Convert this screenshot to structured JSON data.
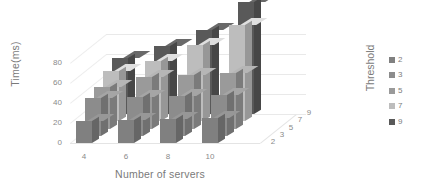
{
  "chart_data": {
    "type": "bar",
    "subtype": "3d-grouped-column",
    "title": "",
    "xlabel": "Number of servers",
    "ylabel": "Time(ms)",
    "zlabel": "Threshold",
    "categories": [
      "4",
      "6",
      "8",
      "10"
    ],
    "xticks": [
      "4",
      "6",
      "8",
      "10"
    ],
    "yticks": [
      "0",
      "20",
      "40",
      "60",
      "80"
    ],
    "zticks": [
      "2",
      "3",
      "5",
      "7",
      "9"
    ],
    "ylim": [
      0,
      100
    ],
    "grid": true,
    "legend_position": "right",
    "legend_title": "Threshold",
    "series": [
      {
        "name": "2",
        "color": "#808080",
        "values": [
          22,
          23,
          24,
          25
        ]
      },
      {
        "name": "3",
        "color": "#8c8c8c",
        "values": [
          38,
          39,
          40,
          41
        ]
      },
      {
        "name": "5",
        "color": "#9a9a9a",
        "values": [
          42,
          52,
          54,
          56
        ]
      },
      {
        "name": "7",
        "color": "#bdbdbd",
        "values": [
          50,
          60,
          76,
          96
        ]
      },
      {
        "name": "9",
        "color": "#595959",
        "values": [
          56,
          68,
          84,
          112
        ]
      }
    ]
  },
  "legend": {
    "title": "Threshold",
    "items": [
      {
        "label": "2",
        "color": "#808080"
      },
      {
        "label": "3",
        "color": "#8c8c8c"
      },
      {
        "label": "5",
        "color": "#9a9a9a"
      },
      {
        "label": "7",
        "color": "#bdbdbd"
      },
      {
        "label": "9",
        "color": "#595959"
      }
    ]
  },
  "axes": {
    "y_title": "Time(ms)",
    "x_title": "Number of servers"
  }
}
